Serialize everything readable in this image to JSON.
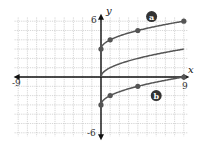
{
  "chart_data": {
    "type": "line",
    "title": "",
    "xlabel": "x",
    "ylabel": "y",
    "xlim": [
      -9,
      9
    ],
    "ylim": [
      -6,
      6
    ],
    "grid": true,
    "grid_step": 1,
    "tick_labels": {
      "x": [
        {
          "value": -9,
          "label": "-9"
        },
        {
          "value": 9,
          "label": "9"
        }
      ],
      "y": [
        {
          "value": 6,
          "label": "6"
        },
        {
          "value": -6,
          "label": "-6"
        }
      ]
    },
    "series": [
      {
        "name": "a",
        "label": "a",
        "equation": "y = sqrt(x) + 3",
        "marked_points": [
          [
            0,
            3
          ],
          [
            1,
            4
          ],
          [
            4,
            5
          ],
          [
            9,
            6
          ]
        ],
        "label_position": [
          5.5,
          6.5
        ]
      },
      {
        "name": "parent",
        "label": "",
        "equation": "y = sqrt(x)",
        "marked_points": []
      },
      {
        "name": "b",
        "label": "b",
        "equation": "y = sqrt(x) - 3",
        "marked_points": [
          [
            0,
            -3
          ],
          [
            1,
            -2
          ],
          [
            4,
            -1
          ],
          [
            9,
            0
          ]
        ],
        "label_position": [
          6,
          -2
        ]
      }
    ]
  },
  "axes": {
    "x_label": "x",
    "y_label": "y",
    "x_min_label": "-9",
    "x_max_label": "9",
    "y_max_label": "6",
    "y_min_label": "-6"
  },
  "colors": {
    "curve": "#555555",
    "axis": "#111111",
    "grid": "#bbbbbb",
    "badge": "#333333",
    "badge_text": "#ffffff"
  }
}
